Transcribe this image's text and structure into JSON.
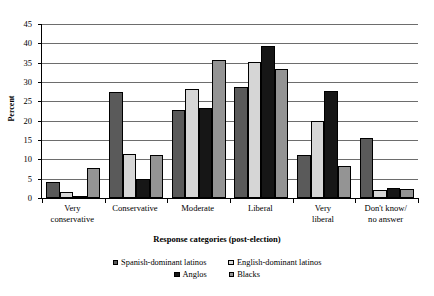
{
  "chart_data": {
    "type": "bar",
    "title": "",
    "xlabel": "Response categories (post-election)",
    "ylabel": "Percent",
    "categories": [
      "Very\nconservative",
      "Conservative",
      "Moderate",
      "Liberal",
      "Very\nliberal",
      "Don't know/\nno answer"
    ],
    "category_lines": [
      [
        "Very",
        "conservative"
      ],
      [
        "Conservative",
        ""
      ],
      [
        "Moderate",
        ""
      ],
      [
        "Liberal",
        ""
      ],
      [
        "Very",
        "liberal"
      ],
      [
        "Don't know/",
        "no answer"
      ]
    ],
    "series": [
      {
        "name": "Spanish-dominant latinos",
        "color": "#5a5a5a",
        "values": [
          4.2,
          27.5,
          22.7,
          28.7,
          11.0,
          15.5
        ]
      },
      {
        "name": "English-dominant latinos",
        "color": "#d6d6d6",
        "values": [
          1.5,
          11.5,
          28.1,
          35.2,
          20.0,
          2.1
        ]
      },
      {
        "name": "Anglos",
        "color": "#161616",
        "values": [
          0.4,
          5.0,
          23.2,
          39.4,
          27.8,
          2.7
        ]
      },
      {
        "name": "Blacks",
        "color": "#949494",
        "values": [
          7.7,
          11.0,
          35.7,
          33.4,
          8.2,
          2.4
        ]
      }
    ],
    "ylim": [
      0,
      45
    ],
    "yticks": [
      0,
      5,
      10,
      15,
      20,
      25,
      30,
      35,
      40,
      45
    ],
    "ytick_labels": [
      "0",
      "5",
      "10",
      "15",
      "20",
      "25",
      "30",
      "35",
      "40",
      "45"
    ],
    "grid": true,
    "legend_position": "bottom"
  }
}
